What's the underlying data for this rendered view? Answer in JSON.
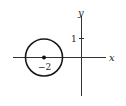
{
  "diagram": {
    "axes": {
      "x_label": "x",
      "y_label": "y"
    },
    "ticks": {
      "y_tick_label": "1"
    },
    "circle": {
      "center_label": "−2",
      "center_x_value": -2,
      "center_y_value": 0,
      "radius_value": 1
    },
    "colors": {
      "stroke": "#1a1a1a",
      "background": "#ffffff"
    }
  }
}
